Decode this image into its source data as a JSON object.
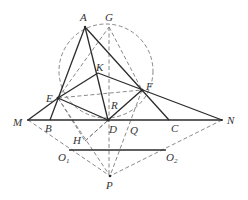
{
  "diagram": {
    "type": "geometry",
    "points": {
      "A": {
        "label": "A",
        "x": 85,
        "y": 27
      },
      "G": {
        "label": "G",
        "x": 109,
        "y": 26
      },
      "K": {
        "label": "K",
        "x": 98,
        "y": 73
      },
      "E": {
        "label": "E",
        "x": 58,
        "y": 98
      },
      "F": {
        "label": "F",
        "x": 142,
        "y": 90
      },
      "R": {
        "label": "R",
        "x": 110,
        "y": 97
      },
      "M": {
        "label": "M",
        "x": 28,
        "y": 120
      },
      "B": {
        "label": "B",
        "x": 50,
        "y": 120
      },
      "D": {
        "label": "D",
        "x": 108,
        "y": 120
      },
      "Q": {
        "label": "Q",
        "x": 126,
        "y": 128
      },
      "C": {
        "label": "C",
        "x": 169,
        "y": 120
      },
      "N": {
        "label": "N",
        "x": 222,
        "y": 120
      },
      "H": {
        "label": "H",
        "x": 85,
        "y": 141
      },
      "O1": {
        "label": "O",
        "sub": "1",
        "x": 69,
        "y": 150
      },
      "O2": {
        "label": "O",
        "sub": "2",
        "x": 166,
        "y": 150
      },
      "P": {
        "label": "P",
        "x": 110,
        "y": 176
      }
    },
    "labels": {
      "A": "A",
      "G": "G",
      "K": "K",
      "E": "E",
      "F": "F",
      "R": "R",
      "M": "M",
      "B": "B",
      "D": "D",
      "Q": "Q",
      "C": "C",
      "N": "N",
      "H": "H",
      "O": "O",
      "P": "P",
      "sub1": "1",
      "sub2": "2"
    },
    "solid_segments": [
      "A-B",
      "A-C",
      "A-D",
      "M-N",
      "M-E",
      "E-K",
      "K-F",
      "F-N",
      "E-D",
      "D-F",
      "O1-O2"
    ],
    "dashed_segments": [
      "G-D",
      "D-P",
      "E-F",
      "E-G",
      "G-F",
      "M-P",
      "N-P",
      "E-P",
      "F-P",
      "H-D",
      "E-H",
      "D-Q",
      "F-Q"
    ],
    "circles": [
      {
        "name": "circumcircle",
        "cx": 109,
        "cy": 72,
        "r": 46
      }
    ]
  }
}
